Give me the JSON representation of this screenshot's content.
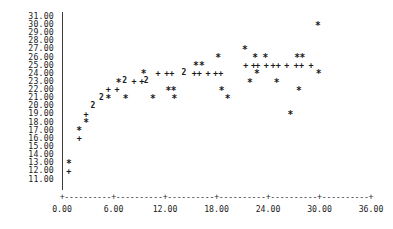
{
  "chart_data": {
    "type": "scatter",
    "title": "",
    "subtitle": "",
    "xlabel": "",
    "ylabel": "",
    "xlim": [
      0.0,
      36.0
    ],
    "ylim": [
      11.0,
      31.0
    ],
    "xticks": [
      "0.00",
      "6.00",
      "12.00",
      "18.00",
      "24.00",
      "30.00",
      "36.00"
    ],
    "xtick_values": [
      0,
      6,
      12,
      18,
      24,
      30,
      36
    ],
    "yticks": [
      "31.00",
      "30.00",
      "29.00",
      "28.00",
      "27.00",
      "26.00",
      "25.00",
      "24.00",
      "23.00",
      "22.00",
      "21.00",
      "20.00",
      "19.00",
      "18.00",
      "17.00",
      "16.00",
      "15.00",
      "14.00",
      "13.00",
      "12.00",
      "11.00"
    ],
    "ytick_values": [
      31,
      30,
      29,
      28,
      27,
      26,
      25,
      24,
      23,
      22,
      21,
      20,
      19,
      18,
      17,
      16,
      15,
      14,
      13,
      12,
      11
    ],
    "grid": false,
    "legend": null,
    "marker_glyphs": {
      "single_a": "*",
      "single_b": "+",
      "overlap_two": "2"
    },
    "axis_style": "character-cell-text-plot",
    "axis_line_chars": "-",
    "axis_tick_char": "+",
    "points": [
      {
        "x": 0.8,
        "y": 13.0,
        "glyph": "*",
        "count": 1
      },
      {
        "x": 0.8,
        "y": 12.0,
        "glyph": "+",
        "count": 1
      },
      {
        "x": 2.0,
        "y": 17.0,
        "glyph": "*",
        "count": 1
      },
      {
        "x": 2.0,
        "y": 16.0,
        "glyph": "+",
        "count": 1
      },
      {
        "x": 2.8,
        "y": 19.0,
        "glyph": "+",
        "count": 1
      },
      {
        "x": 2.8,
        "y": 18.0,
        "glyph": "*",
        "count": 1
      },
      {
        "x": 3.6,
        "y": 20.0,
        "glyph": "2",
        "count": 2
      },
      {
        "x": 4.6,
        "y": 21.0,
        "glyph": "2",
        "count": 2
      },
      {
        "x": 5.4,
        "y": 21.0,
        "glyph": "*",
        "count": 1
      },
      {
        "x": 5.4,
        "y": 22.0,
        "glyph": "+",
        "count": 1
      },
      {
        "x": 6.4,
        "y": 22.0,
        "glyph": "+",
        "count": 1
      },
      {
        "x": 6.6,
        "y": 23.0,
        "glyph": "*",
        "count": 1
      },
      {
        "x": 7.3,
        "y": 23.0,
        "glyph": "2",
        "count": 2
      },
      {
        "x": 7.4,
        "y": 21.0,
        "glyph": "*",
        "count": 1
      },
      {
        "x": 8.4,
        "y": 23.0,
        "glyph": "+",
        "count": 1
      },
      {
        "x": 9.3,
        "y": 23.0,
        "glyph": "+",
        "count": 1
      },
      {
        "x": 9.8,
        "y": 23.0,
        "glyph": "2",
        "count": 2
      },
      {
        "x": 9.5,
        "y": 24.0,
        "glyph": "*",
        "count": 1
      },
      {
        "x": 10.6,
        "y": 21.0,
        "glyph": "*",
        "count": 1
      },
      {
        "x": 11.2,
        "y": 24.0,
        "glyph": "+",
        "count": 1
      },
      {
        "x": 12.2,
        "y": 24.0,
        "glyph": "+",
        "count": 1
      },
      {
        "x": 12.8,
        "y": 24.0,
        "glyph": "+",
        "count": 1
      },
      {
        "x": 12.4,
        "y": 22.0,
        "glyph": "*",
        "count": 1
      },
      {
        "x": 13.0,
        "y": 22.0,
        "glyph": "*",
        "count": 1
      },
      {
        "x": 13.1,
        "y": 21.0,
        "glyph": "*",
        "count": 1
      },
      {
        "x": 14.2,
        "y": 24.0,
        "glyph": "2",
        "count": 2
      },
      {
        "x": 15.4,
        "y": 24.0,
        "glyph": "+",
        "count": 1
      },
      {
        "x": 16.0,
        "y": 24.0,
        "glyph": "+",
        "count": 1
      },
      {
        "x": 15.6,
        "y": 25.0,
        "glyph": "*",
        "count": 1
      },
      {
        "x": 16.3,
        "y": 25.0,
        "glyph": "*",
        "count": 1
      },
      {
        "x": 17.0,
        "y": 24.0,
        "glyph": "+",
        "count": 1
      },
      {
        "x": 17.9,
        "y": 24.0,
        "glyph": "+",
        "count": 1
      },
      {
        "x": 18.5,
        "y": 24.0,
        "glyph": "+",
        "count": 1
      },
      {
        "x": 18.2,
        "y": 26.0,
        "glyph": "*",
        "count": 1
      },
      {
        "x": 18.6,
        "y": 22.0,
        "glyph": "*",
        "count": 1
      },
      {
        "x": 19.3,
        "y": 21.0,
        "glyph": "*",
        "count": 1
      },
      {
        "x": 21.3,
        "y": 27.0,
        "glyph": "*",
        "count": 1
      },
      {
        "x": 21.4,
        "y": 25.0,
        "glyph": "+",
        "count": 1
      },
      {
        "x": 22.3,
        "y": 25.0,
        "glyph": "+",
        "count": 1
      },
      {
        "x": 22.8,
        "y": 25.0,
        "glyph": "+",
        "count": 1
      },
      {
        "x": 22.5,
        "y": 26.0,
        "glyph": "*",
        "count": 1
      },
      {
        "x": 23.7,
        "y": 26.0,
        "glyph": "*",
        "count": 1
      },
      {
        "x": 23.8,
        "y": 25.0,
        "glyph": "+",
        "count": 1
      },
      {
        "x": 22.7,
        "y": 24.0,
        "glyph": "*",
        "count": 1
      },
      {
        "x": 21.9,
        "y": 23.0,
        "glyph": "*",
        "count": 1
      },
      {
        "x": 24.6,
        "y": 25.0,
        "glyph": "+",
        "count": 1
      },
      {
        "x": 25.2,
        "y": 25.0,
        "glyph": "+",
        "count": 1
      },
      {
        "x": 25.0,
        "y": 23.0,
        "glyph": "*",
        "count": 1
      },
      {
        "x": 26.2,
        "y": 25.0,
        "glyph": "+",
        "count": 1
      },
      {
        "x": 26.6,
        "y": 19.0,
        "glyph": "*",
        "count": 1
      },
      {
        "x": 27.3,
        "y": 25.0,
        "glyph": "+",
        "count": 1
      },
      {
        "x": 27.9,
        "y": 25.0,
        "glyph": "+",
        "count": 1
      },
      {
        "x": 27.4,
        "y": 26.0,
        "glyph": "*",
        "count": 1
      },
      {
        "x": 28.0,
        "y": 26.0,
        "glyph": "*",
        "count": 1
      },
      {
        "x": 27.6,
        "y": 22.0,
        "glyph": "*",
        "count": 1
      },
      {
        "x": 29.0,
        "y": 25.0,
        "glyph": "+",
        "count": 1
      },
      {
        "x": 29.8,
        "y": 30.0,
        "glyph": "*",
        "count": 1
      },
      {
        "x": 29.9,
        "y": 24.0,
        "glyph": "*",
        "count": 1
      }
    ]
  }
}
